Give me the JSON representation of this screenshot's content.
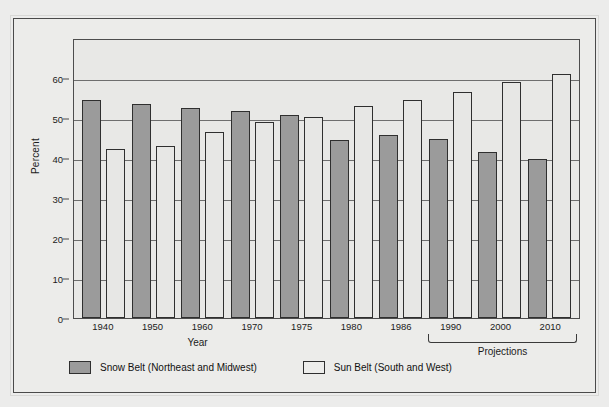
{
  "chart_data": {
    "type": "bar",
    "title": "",
    "xlabel": "Year",
    "ylabel": "Percent",
    "ylim": [
      0,
      70
    ],
    "yticks": [
      0,
      10,
      20,
      30,
      40,
      50,
      60
    ],
    "grid": true,
    "legend_position": "bottom-left",
    "categories": [
      "1940",
      "1950",
      "1960",
      "1970",
      "1975",
      "1980",
      "1986",
      "1990",
      "2000",
      "2010"
    ],
    "series": [
      {
        "name": "Snow Belt (Northeast and Midwest)",
        "color": "#9b9b9b",
        "values": [
          54.5,
          53.5,
          52.5,
          51.8,
          50.8,
          44.5,
          45.7,
          44.7,
          41.5,
          39.7
        ]
      },
      {
        "name": "Sun Belt (South and West)",
        "color": "#e7e7e5",
        "values": [
          42.2,
          43.0,
          46.6,
          48.9,
          50.2,
          53.0,
          54.4,
          56.4,
          59.0,
          61.0
        ]
      }
    ],
    "annotations": [
      {
        "text": "Projections",
        "covers": [
          "1990",
          "2000",
          "2010"
        ]
      }
    ]
  },
  "axis": {
    "y_title": "Percent",
    "x_title": "Year",
    "y_tick_labels": [
      "60",
      "50",
      "40",
      "30",
      "20",
      "10",
      "0"
    ]
  },
  "legend": {
    "items": [
      {
        "label": "Snow Belt (Northeast and Midwest)",
        "swatch": "snow"
      },
      {
        "label": "Sun Belt (South and West)",
        "swatch": "sun"
      }
    ]
  },
  "projections": {
    "label": "Projections"
  }
}
